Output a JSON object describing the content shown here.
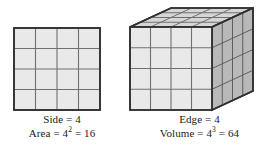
{
  "figure": {
    "background_color": "#ffffff",
    "line_color": "#4a4a4a",
    "border_color": "#333333",
    "text_color": "#1a1a1a"
  },
  "square": {
    "name": "square-figure",
    "divisions": 4,
    "cell_count": 16,
    "face_fill": "#e9e9e9",
    "grid_line_color": "#707070",
    "border_color": "#303030",
    "caption": {
      "line1_label": "Side",
      "line1_equals": "=",
      "line1_value": "4",
      "line2_label": "Area",
      "line2_equals_1": "=",
      "line2_base": "4",
      "line2_exponent": "2",
      "line2_equals_2": "=",
      "line2_result": "16"
    }
  },
  "cube": {
    "name": "cube-figure",
    "divisions": 4,
    "cell_count": 64,
    "front_face_fill": "#e9e9e9",
    "top_face_fill": "#d6d6d6",
    "right_face_fill": "#b9b9b9",
    "grid_line_color": "#707070",
    "border_color": "#303030",
    "caption": {
      "line1_label": "Edge",
      "line1_equals": "=",
      "line1_value": "4",
      "line2_label": "Volume",
      "line2_equals_1": "=",
      "line2_base": "4",
      "line2_exponent": "3",
      "line2_equals_2": "=",
      "line2_result": "64"
    }
  }
}
